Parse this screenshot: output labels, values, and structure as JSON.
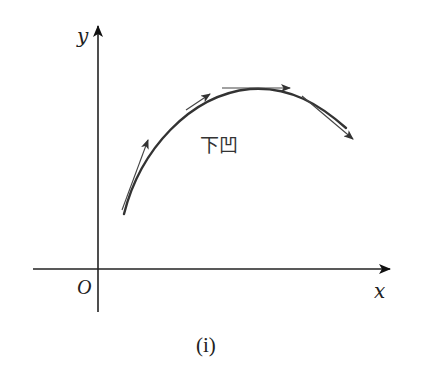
{
  "diagram": {
    "axes": {
      "x_label": "x",
      "y_label": "y",
      "origin_label": "O"
    },
    "curve": {
      "description": "concave-down curve with tangent arrows",
      "region_label": "下凹",
      "tangent_arrow_count": 4
    },
    "caption": "(i)",
    "colors": {
      "stroke": "#333333",
      "background": "#ffffff"
    }
  }
}
